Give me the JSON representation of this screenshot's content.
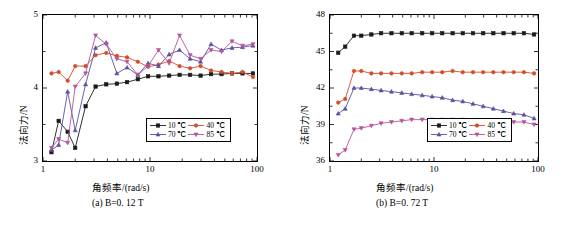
{
  "figure": {
    "panel_a_caption": "(a) B=0. 12 T",
    "panel_b_caption": "(b) B=0. 72 T"
  },
  "chart_data": [
    {
      "id": "panel-a",
      "type": "line",
      "title": "(a) B=0. 12 T",
      "xlabel": "角频率/(rad/s)",
      "ylabel": "法向力/N",
      "xscale": "log",
      "xlim": [
        1,
        100
      ],
      "ylim": [
        3,
        5
      ],
      "yticks": [
        3,
        4,
        5
      ],
      "ytick_labels": [
        "3",
        "4",
        "5"
      ],
      "xticks": [
        1,
        10,
        100
      ],
      "xtick_labels": [
        "1",
        "10",
        "100"
      ],
      "grid": false,
      "legend_position": "bottom-right",
      "series": [
        {
          "name": "10 ℃",
          "color": "#1a1a1a",
          "marker": "square",
          "x": [
            1.2,
            1.4,
            1.7,
            2.0,
            2.5,
            3.1,
            3.9,
            4.9,
            6.1,
            7.7,
            9.6,
            12.0,
            15.1,
            18.9,
            23.7,
            29.7,
            37.2,
            46.6,
            58.4,
            73.2,
            91.7
          ],
          "y": [
            3.12,
            3.55,
            3.4,
            3.18,
            3.75,
            4.02,
            4.05,
            4.06,
            4.08,
            4.12,
            4.16,
            4.16,
            4.17,
            4.18,
            4.18,
            4.17,
            4.19,
            4.19,
            4.2,
            4.2,
            4.2
          ]
        },
        {
          "name": "40 ℃",
          "color": "#d24d28",
          "marker": "circle",
          "x": [
            1.2,
            1.4,
            1.7,
            2.0,
            2.5,
            3.1,
            3.9,
            4.9,
            6.1,
            7.7,
            9.6,
            12.0,
            15.1,
            18.9,
            23.7,
            29.7,
            37.2,
            46.6,
            58.4,
            73.2,
            91.7
          ],
          "y": [
            4.2,
            4.22,
            4.1,
            4.3,
            4.3,
            4.45,
            4.48,
            4.44,
            4.42,
            4.36,
            4.29,
            4.32,
            4.37,
            4.3,
            4.27,
            4.3,
            4.24,
            4.22,
            4.2,
            4.22,
            4.15
          ]
        },
        {
          "name": "70 ℃",
          "color": "#5b4fa0",
          "marker": "triangle",
          "x": [
            1.2,
            1.4,
            1.7,
            2.0,
            2.5,
            3.1,
            3.9,
            4.9,
            6.1,
            7.7,
            9.6,
            12.0,
            15.1,
            18.9,
            23.7,
            29.7,
            37.2,
            46.6,
            58.4,
            73.2,
            91.7
          ],
          "y": [
            3.15,
            3.22,
            3.95,
            3.42,
            4.05,
            4.55,
            4.62,
            4.2,
            4.28,
            4.18,
            4.34,
            4.3,
            4.46,
            4.52,
            4.4,
            4.36,
            4.6,
            4.52,
            4.55,
            4.56,
            4.58
          ]
        },
        {
          "name": "85 ℃",
          "color": "#b4569a",
          "marker": "dtriangle",
          "x": [
            1.2,
            1.4,
            1.7,
            2.0,
            2.5,
            3.1,
            3.9,
            4.9,
            6.1,
            7.7,
            9.6,
            12.0,
            15.1,
            18.9,
            23.7,
            29.7,
            37.2,
            46.6,
            58.4,
            73.2,
            91.7
          ],
          "y": [
            3.18,
            3.3,
            3.25,
            4.02,
            4.2,
            4.72,
            4.6,
            4.4,
            4.36,
            4.18,
            4.3,
            4.52,
            4.34,
            4.72,
            4.45,
            4.4,
            4.52,
            4.5,
            4.64,
            4.58,
            4.6
          ]
        }
      ]
    },
    {
      "id": "panel-b",
      "type": "line",
      "title": "(b) B=0. 72 T",
      "xlabel": "角频率/(rad/s)",
      "ylabel": "法向力/N",
      "xscale": "log",
      "xlim": [
        1,
        100
      ],
      "ylim": [
        36,
        48
      ],
      "yticks": [
        36,
        39,
        42,
        45,
        48
      ],
      "ytick_labels": [
        "36",
        "39",
        "42",
        "45",
        "48"
      ],
      "xticks": [
        1,
        10,
        100
      ],
      "xtick_labels": [
        "1",
        "10",
        "100"
      ],
      "grid": false,
      "legend_position": "bottom-right",
      "series": [
        {
          "name": "10 ℃",
          "color": "#1a1a1a",
          "marker": "square",
          "x": [
            1.2,
            1.4,
            1.7,
            2.0,
            2.5,
            3.1,
            3.9,
            4.9,
            6.1,
            7.7,
            9.6,
            12.0,
            15.1,
            18.9,
            23.7,
            29.7,
            37.2,
            46.6,
            58.4,
            73.2,
            91.7
          ],
          "y": [
            44.9,
            45.4,
            46.3,
            46.3,
            46.4,
            46.5,
            46.5,
            46.5,
            46.5,
            46.5,
            46.5,
            46.5,
            46.5,
            46.5,
            46.5,
            46.5,
            46.5,
            46.5,
            46.5,
            46.5,
            46.4
          ]
        },
        {
          "name": "40 ℃",
          "color": "#d24d28",
          "marker": "circle",
          "x": [
            1.2,
            1.4,
            1.7,
            2.0,
            2.5,
            3.1,
            3.9,
            4.9,
            6.1,
            7.7,
            9.6,
            12.0,
            15.1,
            18.9,
            23.7,
            29.7,
            37.2,
            46.6,
            58.4,
            73.2,
            91.7
          ],
          "y": [
            40.8,
            41.1,
            43.4,
            43.4,
            43.2,
            43.2,
            43.2,
            43.2,
            43.2,
            43.3,
            43.3,
            43.3,
            43.4,
            43.3,
            43.3,
            43.3,
            43.3,
            43.3,
            43.3,
            43.3,
            43.2
          ]
        },
        {
          "name": "70 ℃",
          "color": "#5b4fa0",
          "marker": "triangle",
          "x": [
            1.2,
            1.4,
            1.7,
            2.0,
            2.5,
            3.1,
            3.9,
            4.9,
            6.1,
            7.7,
            9.6,
            12.0,
            15.1,
            18.9,
            23.7,
            29.7,
            37.2,
            46.6,
            58.4,
            73.2,
            91.7
          ],
          "y": [
            39.9,
            40.3,
            42.0,
            42.0,
            41.9,
            41.8,
            41.7,
            41.6,
            41.5,
            41.4,
            41.3,
            41.2,
            41.0,
            40.9,
            40.7,
            40.5,
            40.3,
            40.1,
            39.9,
            39.8,
            39.5
          ]
        },
        {
          "name": "85 ℃",
          "color": "#b4569a",
          "marker": "dtriangle",
          "x": [
            1.2,
            1.4,
            1.7,
            2.0,
            2.5,
            3.1,
            3.9,
            4.9,
            6.1,
            7.7,
            9.6,
            12.0,
            15.1,
            18.9,
            23.7,
            29.7,
            37.2,
            46.6,
            58.4,
            73.2,
            91.7
          ],
          "y": [
            36.5,
            36.9,
            38.6,
            38.7,
            38.9,
            39.1,
            39.2,
            39.3,
            39.4,
            39.4,
            39.4,
            39.4,
            39.4,
            39.4,
            39.3,
            39.3,
            39.3,
            39.3,
            39.2,
            39.2,
            39.0
          ]
        }
      ]
    }
  ]
}
